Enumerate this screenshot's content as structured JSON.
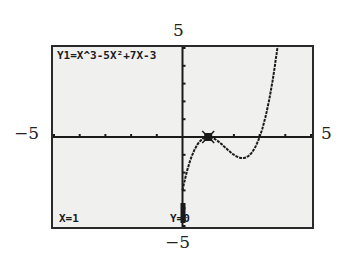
{
  "window": {
    "xmin": -5,
    "xmax": 5,
    "ymin": -5,
    "ymax": 5,
    "labels": {
      "top": "5",
      "bottom": "−5",
      "left": "−5",
      "right": "5"
    }
  },
  "screen": {
    "equation": "Y1=X^3-5X²+7X-3",
    "trace_x": "X=1",
    "trace_y": "Y=0",
    "background": "#f0f0ef",
    "ink": "#1a1a1a"
  },
  "chart_data": {
    "type": "line",
    "title": "Y1=X^3-5X²+7X-3",
    "function": "x^3-5x^2+7x-3",
    "xlabel": "",
    "ylabel": "",
    "xlim": [
      -5,
      5
    ],
    "ylim": [
      -5,
      5
    ],
    "x_ticks": [
      -5,
      -4,
      -3,
      -2,
      -1,
      0,
      1,
      2,
      3,
      4,
      5
    ],
    "y_ticks": [
      -5,
      -4,
      -3,
      -2,
      -1,
      0,
      1,
      2,
      3,
      4,
      5
    ],
    "grid": false,
    "series": [
      {
        "name": "Y1",
        "x": [
          0,
          0.25,
          0.5,
          0.75,
          1,
          1.25,
          1.5,
          1.75,
          2,
          2.333,
          2.5,
          2.75,
          3,
          3.25,
          3.5,
          3.75,
          4,
          4.25
        ],
        "y": [
          -3,
          -1.42,
          -0.63,
          -0.17,
          0,
          -0.11,
          -0.38,
          -0.7,
          -1,
          -1.19,
          -1.13,
          -0.8,
          0,
          1.41,
          3.13,
          5.3,
          9,
          12.2
        ]
      }
    ],
    "trace_point": {
      "x": 1,
      "y": 0
    },
    "annotations": [
      "X=1",
      "Y=0"
    ]
  }
}
